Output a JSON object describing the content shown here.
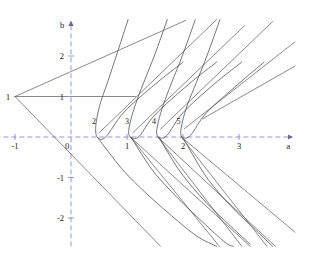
{
  "figure": {
    "title": "",
    "background_color": "#ffffff",
    "ink_color": "#4a4a4a",
    "axis_color": "#8d8dbd",
    "label_color": "#1a1a1a"
  },
  "axes": {
    "x_axis_name": "a",
    "y_axis_name": "b",
    "x_ticks": [
      {
        "value": -1,
        "label": "-1"
      },
      {
        "value": 0,
        "label": "0"
      },
      {
        "value": 1,
        "label": "1"
      },
      {
        "value": 2,
        "label": "2"
      },
      {
        "value": 3,
        "label": "3"
      }
    ],
    "y_ticks": [
      {
        "value": 2,
        "label": "2"
      },
      {
        "value": 1,
        "label": "1"
      },
      {
        "value": -1,
        "label": "-1"
      },
      {
        "value": -2,
        "label": "-2"
      }
    ],
    "x_range": [
      -1.35,
      4.0
    ],
    "y_range": [
      -2.7,
      2.9
    ],
    "origin_label": "0",
    "style": "dashed-arrow-axes",
    "grid": false
  },
  "annotations": {
    "vertex_label": "1",
    "vertex_point": [
      -1,
      1
    ],
    "curve_labels": [
      {
        "text": "2",
        "a": 0.41,
        "b": 0.33
      },
      {
        "text": "3",
        "a": 1.0,
        "b": 0.33
      },
      {
        "text": "4",
        "a": 1.48,
        "b": 0.33
      },
      {
        "text": "5",
        "a": 1.92,
        "b": 0.33
      }
    ]
  },
  "chart_data": {
    "type": "line",
    "title": "",
    "xlabel": "a",
    "ylabel": "b",
    "xlim": [
      -1.35,
      4.0
    ],
    "ylim": [
      -2.7,
      2.9
    ],
    "grid": false,
    "legend": "none",
    "series": [
      {
        "name": "vertex-upper-ray",
        "kind": "line",
        "points": [
          [
            -1,
            1
          ],
          [
            2.05,
            2.88
          ]
        ]
      },
      {
        "name": "vertex-horizontal-ray",
        "kind": "line",
        "points": [
          [
            -1,
            1
          ],
          [
            1.15,
            1.0
          ]
        ]
      },
      {
        "name": "vertex-lower-ray",
        "kind": "line",
        "points": [
          [
            -1,
            1
          ],
          [
            1.6,
            -2.7
          ]
        ]
      },
      {
        "name": "cusp-2-curve",
        "kind": "curve",
        "cusp": [
          0.45,
          0.0
        ],
        "points": [
          [
            1.02,
            2.9
          ],
          [
            0.82,
            2.05
          ],
          [
            0.66,
            1.38
          ],
          [
            0.53,
            0.86
          ],
          [
            0.46,
            0.45
          ],
          [
            0.44,
            0.15
          ],
          [
            0.48,
            -0.02
          ],
          [
            0.62,
            0.0
          ],
          [
            0.95,
            0.62
          ],
          [
            1.5,
            1.3
          ],
          [
            2.0,
            1.85
          ]
        ]
      },
      {
        "name": "cusp-3-curve",
        "kind": "curve",
        "cusp": [
          1.06,
          0.0
        ],
        "points": [
          [
            1.72,
            2.9
          ],
          [
            1.5,
            2.05
          ],
          [
            1.3,
            1.35
          ],
          [
            1.15,
            0.8
          ],
          [
            1.06,
            0.38
          ],
          [
            1.03,
            0.1
          ],
          [
            1.08,
            -0.02
          ],
          [
            1.22,
            0.02
          ],
          [
            1.5,
            0.55
          ],
          [
            2.1,
            1.3
          ],
          [
            2.6,
            1.85
          ]
        ]
      },
      {
        "name": "cusp-4-curve",
        "kind": "curve",
        "cusp": [
          1.55,
          0.0
        ],
        "points": [
          [
            2.22,
            2.9
          ],
          [
            2.0,
            2.05
          ],
          [
            1.8,
            1.35
          ],
          [
            1.65,
            0.8
          ],
          [
            1.56,
            0.38
          ],
          [
            1.53,
            0.1
          ],
          [
            1.58,
            -0.02
          ],
          [
            1.72,
            0.05
          ],
          [
            2.0,
            0.6
          ],
          [
            2.55,
            1.3
          ],
          [
            3.05,
            1.85
          ]
        ]
      },
      {
        "name": "cusp-5-curve",
        "kind": "curve",
        "cusp": [
          1.97,
          0.0
        ],
        "points": [
          [
            2.66,
            2.9
          ],
          [
            2.44,
            2.05
          ],
          [
            2.24,
            1.35
          ],
          [
            2.08,
            0.8
          ],
          [
            1.99,
            0.38
          ],
          [
            1.96,
            0.1
          ],
          [
            2.0,
            -0.02
          ],
          [
            2.14,
            0.05
          ],
          [
            2.42,
            0.6
          ],
          [
            2.98,
            1.3
          ],
          [
            3.45,
            1.85
          ]
        ]
      },
      {
        "name": "cusp-2-tail",
        "kind": "curve",
        "points": [
          [
            0.48,
            -0.02
          ],
          [
            0.66,
            -0.35
          ],
          [
            0.95,
            -0.85
          ],
          [
            1.35,
            -1.4
          ],
          [
            1.8,
            -1.95
          ],
          [
            2.25,
            -2.45
          ],
          [
            2.6,
            -2.7
          ]
        ]
      },
      {
        "name": "cusp-3-tail",
        "kind": "curve",
        "points": [
          [
            1.08,
            -0.02
          ],
          [
            1.25,
            -0.4
          ],
          [
            1.5,
            -0.9
          ],
          [
            1.9,
            -1.5
          ],
          [
            2.35,
            -2.1
          ],
          [
            2.75,
            -2.6
          ],
          [
            2.9,
            -2.7
          ]
        ]
      },
      {
        "name": "cusp-4-tail",
        "kind": "curve",
        "points": [
          [
            1.58,
            -0.02
          ],
          [
            1.76,
            -0.45
          ],
          [
            2.0,
            -0.95
          ],
          [
            2.4,
            -1.6
          ],
          [
            2.85,
            -2.2
          ],
          [
            3.2,
            -2.65
          ]
        ]
      },
      {
        "name": "cusp-5-tail",
        "kind": "curve",
        "points": [
          [
            2.0,
            -0.02
          ],
          [
            2.2,
            -0.5
          ],
          [
            2.45,
            -1.05
          ],
          [
            2.85,
            -1.7
          ],
          [
            3.3,
            -2.3
          ],
          [
            3.6,
            -2.7
          ]
        ]
      },
      {
        "name": "ray-down-from-1a",
        "kind": "line",
        "points": [
          [
            1.06,
            0.0
          ],
          [
            2.65,
            -2.7
          ]
        ]
      },
      {
        "name": "ray-down-from-1b",
        "kind": "line",
        "points": [
          [
            1.06,
            0.0
          ],
          [
            3.2,
            -2.7
          ]
        ]
      },
      {
        "name": "ray-down-from-2a",
        "kind": "line",
        "points": [
          [
            1.55,
            0.0
          ],
          [
            3.05,
            -2.7
          ]
        ]
      },
      {
        "name": "ray-down-from-2b",
        "kind": "line",
        "points": [
          [
            1.55,
            0.0
          ],
          [
            3.65,
            -2.7
          ]
        ]
      },
      {
        "name": "ray-down-from-3a",
        "kind": "line",
        "points": [
          [
            1.97,
            0.0
          ],
          [
            3.5,
            -2.7
          ]
        ]
      },
      {
        "name": "ray-down-from-3b",
        "kind": "line",
        "points": [
          [
            1.97,
            0.0
          ],
          [
            4.0,
            -2.35
          ]
        ]
      },
      {
        "name": "ray-up-1",
        "kind": "line",
        "points": [
          [
            0.5,
            0.1
          ],
          [
            2.6,
            2.9
          ]
        ]
      },
      {
        "name": "ray-up-2",
        "kind": "line",
        "points": [
          [
            1.1,
            0.1
          ],
          [
            3.1,
            2.75
          ]
        ]
      },
      {
        "name": "ray-up-3",
        "kind": "line",
        "points": [
          [
            1.6,
            0.2
          ],
          [
            3.6,
            2.85
          ]
        ]
      },
      {
        "name": "ray-up-4",
        "kind": "line",
        "points": [
          [
            2.02,
            0.2
          ],
          [
            4.0,
            2.35
          ]
        ]
      },
      {
        "name": "ray-up-5",
        "kind": "line",
        "points": [
          [
            2.35,
            0.45
          ],
          [
            4.0,
            1.75
          ]
        ]
      }
    ]
  }
}
